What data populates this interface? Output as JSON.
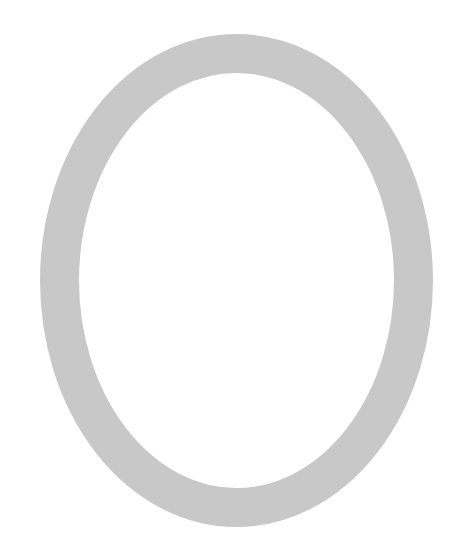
{
  "shape": {
    "type": "oval-ring",
    "ring_color": "#c8c8c8",
    "background_color": "#ffffff",
    "center_x": 236.5,
    "center_y": 280.5,
    "outer_rx": 196.5,
    "outer_ry": 246.5,
    "stroke_width": 39
  }
}
